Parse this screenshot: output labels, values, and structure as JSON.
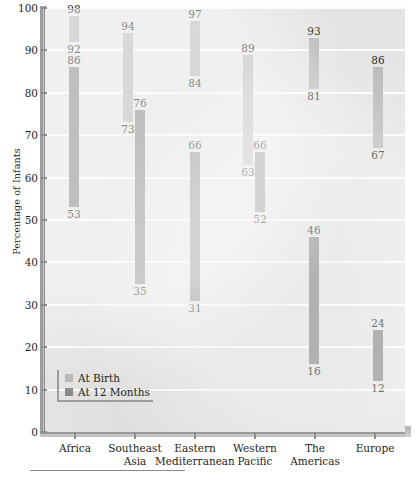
{
  "chart_data": {
    "type": "bar",
    "subtype": "floating-range-bar",
    "title": "",
    "xlabel": "",
    "ylabel": "Percentage of Infants",
    "ylim": [
      0,
      100
    ],
    "ytick_step": 10,
    "ytick_labels": [
      "0",
      "10",
      "20",
      "30",
      "40",
      "50",
      "60",
      "70",
      "80",
      "90",
      "100"
    ],
    "grid": true,
    "legend_position": "inside-lower-left",
    "categories": [
      "Africa",
      "Southeast Asia",
      "Eastern Mediterranean",
      "Western Pacific",
      "The Americas",
      "Europe"
    ],
    "category_lines": [
      [
        "Africa"
      ],
      [
        "Southeast",
        "Asia"
      ],
      [
        "Eastern",
        "Mediterranean"
      ],
      [
        "Western",
        "Pacific"
      ],
      [
        "The",
        "Americas"
      ],
      [
        "Europe"
      ]
    ],
    "series": [
      {
        "name": "At Birth",
        "color": "#b9b9b9",
        "low": [
          92,
          73,
          84,
          63,
          81,
          67
        ],
        "high": [
          98,
          94,
          97,
          89,
          93,
          86
        ]
      },
      {
        "name": "At 12 Months",
        "color": "#8a8a8a",
        "low": [
          53,
          35,
          31,
          52,
          16,
          12
        ],
        "high": [
          86,
          76,
          66,
          66,
          46,
          24
        ]
      }
    ],
    "colors": {
      "plot_background": "#e4e4e4",
      "gridline": "#fafafa",
      "axis": "#8d8d8d",
      "at_birth": "#b9b9b9",
      "at_12_months": "#8a8a8a",
      "text": "#231f20"
    }
  },
  "legend": {
    "items": [
      {
        "label": "At Birth",
        "key": "birth"
      },
      {
        "label": "At 12 Months",
        "key": "months"
      }
    ]
  }
}
